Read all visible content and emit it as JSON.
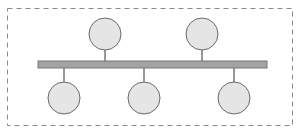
{
  "diagram": {
    "type": "bus-topology",
    "frame": {
      "x": 7.5,
      "y": 8.5,
      "width": 285,
      "height": 117,
      "stroke": "#8a8a8a",
      "dash": "5,4"
    },
    "bus": {
      "x": 38,
      "y": 61,
      "width": 229,
      "height": 7,
      "fill": "#a3a3a3",
      "stroke": "#777777"
    },
    "node_style": {
      "radius": 16,
      "fill": "#e5e5e5",
      "stroke": "#6a6a6a"
    },
    "stem_color": "#555555",
    "nodes": [
      {
        "id": "top-1",
        "side": "top",
        "cx": 105,
        "cy": 34
      },
      {
        "id": "top-2",
        "side": "top",
        "cx": 202,
        "cy": 34
      },
      {
        "id": "bottom-1",
        "side": "bottom",
        "cx": 64,
        "cy": 98
      },
      {
        "id": "bottom-2",
        "side": "bottom",
        "cx": 144,
        "cy": 98
      },
      {
        "id": "bottom-3",
        "side": "bottom",
        "cx": 234,
        "cy": 98
      }
    ]
  }
}
